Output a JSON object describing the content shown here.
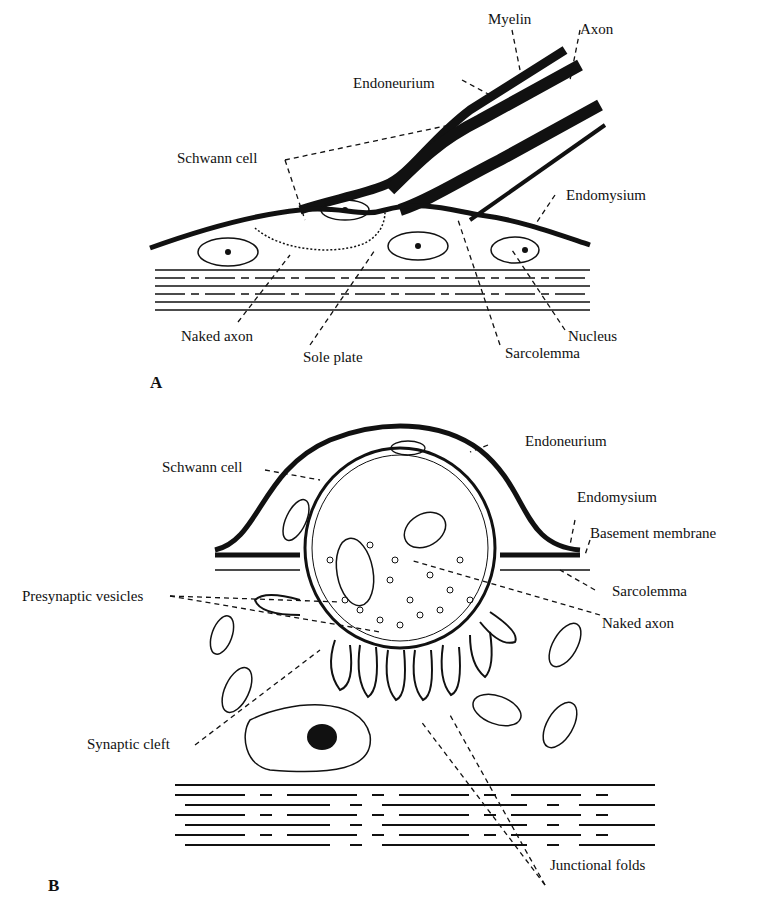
{
  "figure": {
    "panel_a": {
      "letter": "A",
      "labels": {
        "myelin": "Myelin",
        "axon": "Axon",
        "endoneurium": "Endoneurium",
        "schwann_cell": "Schwann cell",
        "endomysium": "Endomysium",
        "naked_axon": "Naked axon",
        "sole_plate": "Sole plate",
        "sarcolemma": "Sarcolemma",
        "nucleus": "Nucleus"
      }
    },
    "panel_b": {
      "letter": "B",
      "labels": {
        "endoneurium": "Endoneurium",
        "schwann_cell": "Schwann cell",
        "endomysium": "Endomysium",
        "basement_membrane": "Basement membrane",
        "sarcolemma": "Sarcolemma",
        "presynaptic_vesicles": "Presynaptic vesicles",
        "naked_axon": "Naked axon",
        "synaptic_cleft": "Synaptic cleft",
        "junctional_folds": "Junctional folds"
      }
    },
    "colors": {
      "ink": "#111111",
      "background": "#ffffff"
    }
  }
}
